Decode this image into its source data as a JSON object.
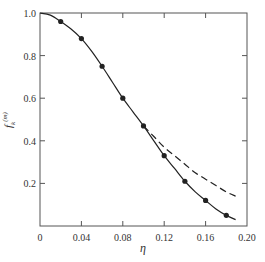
{
  "chart_data": {
    "type": "line",
    "title": "",
    "xlabel": "η",
    "ylabel": "f_k^(m)",
    "xlim": [
      0,
      0.2
    ],
    "ylim": [
      0,
      1.0
    ],
    "grid": false,
    "legend": null,
    "x_ticks": [
      0,
      0.04,
      0.08,
      0.12,
      0.16,
      0.2
    ],
    "x_tick_labels": [
      "0",
      "0.04",
      "0.08",
      "0.12",
      "0.16",
      "0.20"
    ],
    "y_ticks": [
      0.2,
      0.4,
      0.6,
      0.8,
      1.0
    ],
    "y_tick_labels": [
      "0.2",
      "0.4",
      "0.6",
      "0.8",
      "1.0"
    ],
    "series": [
      {
        "name": "solid curve",
        "style": "solid",
        "x": [
          0,
          0.01,
          0.02,
          0.03,
          0.04,
          0.05,
          0.06,
          0.07,
          0.08,
          0.09,
          0.1,
          0.11,
          0.12,
          0.13,
          0.14,
          0.15,
          0.16,
          0.17,
          0.18,
          0.189
        ],
        "y": [
          1.0,
          0.99,
          0.96,
          0.925,
          0.88,
          0.82,
          0.75,
          0.675,
          0.6,
          0.535,
          0.47,
          0.4,
          0.33,
          0.27,
          0.21,
          0.16,
          0.12,
          0.08,
          0.05,
          0.03
        ]
      },
      {
        "name": "dashed curve",
        "style": "dashed",
        "x": [
          0.1,
          0.11,
          0.12,
          0.13,
          0.14,
          0.15,
          0.16,
          0.17,
          0.18,
          0.189
        ],
        "y": [
          0.47,
          0.42,
          0.37,
          0.33,
          0.29,
          0.25,
          0.22,
          0.19,
          0.16,
          0.14
        ]
      },
      {
        "name": "data points",
        "style": "markers",
        "x": [
          0.02,
          0.04,
          0.06,
          0.08,
          0.1,
          0.12,
          0.14,
          0.16,
          0.18
        ],
        "y": [
          0.96,
          0.88,
          0.75,
          0.6,
          0.47,
          0.33,
          0.21,
          0.12,
          0.05
        ]
      }
    ]
  },
  "colors": {
    "line": "#222222",
    "axis": "#555555",
    "text": "#333333"
  }
}
